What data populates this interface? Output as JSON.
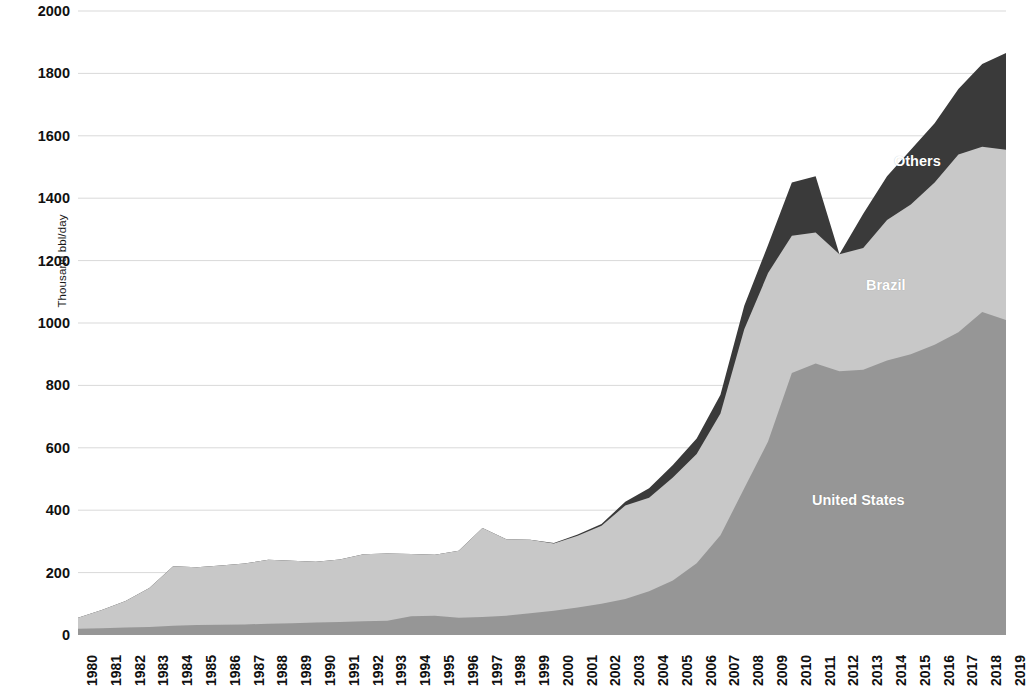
{
  "chart_data": {
    "type": "area",
    "stacked": true,
    "title": "",
    "subtitle": "",
    "xlabel": "",
    "ylabel": "Thousand bbl/day",
    "ylim": [
      0,
      2000
    ],
    "ytick_step": 200,
    "grid": true,
    "legend_position": "inline-annotations",
    "categories": [
      "1980",
      "1981",
      "1982",
      "1983",
      "1984",
      "1985",
      "1986",
      "1987",
      "1988",
      "1989",
      "1990",
      "1991",
      "1992",
      "1993",
      "1994",
      "1995",
      "1996",
      "1997",
      "1998",
      "1999",
      "2000",
      "2001",
      "2002",
      "2003",
      "2004",
      "2005",
      "2006",
      "2007",
      "2008",
      "2009",
      "2010",
      "2011",
      "2012",
      "2013",
      "2014",
      "2015",
      "2016",
      "2017",
      "2018",
      "2019"
    ],
    "ytick_labels": [
      "0",
      "200",
      "400",
      "600",
      "800",
      "1000",
      "1200",
      "1400",
      "1600",
      "1800",
      "2000"
    ],
    "series": [
      {
        "name": "United States",
        "color": "#969696",
        "values": [
          20,
          22,
          24,
          26,
          30,
          32,
          33,
          34,
          36,
          38,
          40,
          42,
          44,
          46,
          60,
          62,
          55,
          58,
          62,
          70,
          78,
          88,
          100,
          115,
          140,
          175,
          230,
          320,
          470,
          620,
          840,
          870,
          845,
          850,
          880,
          900,
          930,
          970,
          1035,
          1010
        ]
      },
      {
        "name": "Brazil",
        "color": "#c8c8c8",
        "values": [
          35,
          58,
          85,
          125,
          190,
          185,
          190,
          195,
          205,
          200,
          195,
          200,
          215,
          215,
          200,
          195,
          215,
          285,
          245,
          235,
          215,
          230,
          250,
          300,
          300,
          330,
          350,
          390,
          510,
          540,
          440,
          420,
          375,
          390,
          450,
          480,
          520,
          570,
          530,
          545
        ]
      },
      {
        "name": "Others",
        "color": "#3a3a3a",
        "values": [
          0,
          0,
          0,
          0,
          0,
          0,
          0,
          0,
          0,
          0,
          0,
          0,
          0,
          0,
          0,
          0,
          0,
          0,
          0,
          0,
          2,
          4,
          6,
          12,
          30,
          40,
          50,
          60,
          75,
          90,
          170,
          180,
          0,
          110,
          140,
          175,
          190,
          210,
          265,
          310
        ]
      }
    ],
    "annotations": [
      {
        "text": "Others",
        "series": "Others"
      },
      {
        "text": "Brazil",
        "series": "Brazil"
      },
      {
        "text": "United States",
        "series": "United States"
      }
    ]
  },
  "labels": {
    "y_axis_title": "Thousand bbl/day",
    "series_us": "United States",
    "series_brazil": "Brazil",
    "series_others": "Others"
  }
}
